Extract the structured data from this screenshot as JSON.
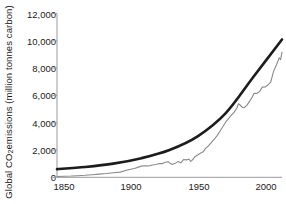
{
  "chart_data": {
    "type": "line",
    "title": "",
    "xlabel": "",
    "ylabel": "Global CO2 emissions (million tonnes carbon)",
    "ylabel_prefix": "Global CO",
    "ylabel_sub": "2",
    "ylabel_suffix": " emissions (million tonnes carbon)",
    "xlim": [
      1850,
      2010
    ],
    "ylim": [
      0,
      12000
    ],
    "grid": false,
    "legend": "none",
    "yticks": [
      0,
      2000,
      4000,
      6000,
      8000,
      10000,
      12000
    ],
    "ytick_labels": [
      "0",
      "2,000",
      "4,000",
      "6,000",
      "8,000",
      "10,000",
      "12,000"
    ],
    "xticks": [
      1850,
      1900,
      1950,
      2000
    ],
    "xtick_labels": [
      "1850",
      "1900",
      "1950",
      "2000"
    ],
    "series": [
      {
        "name": "Observed annual emissions",
        "color": "#8a8a8a",
        "style": "jagged-line",
        "x": [
          1850,
          1855,
          1860,
          1865,
          1870,
          1875,
          1880,
          1885,
          1890,
          1895,
          1900,
          1905,
          1910,
          1913,
          1915,
          1918,
          1920,
          1923,
          1925,
          1927,
          1929,
          1930,
          1932,
          1934,
          1936,
          1938,
          1940,
          1942,
          1944,
          1945,
          1946,
          1948,
          1950,
          1952,
          1954,
          1956,
          1958,
          1960,
          1962,
          1964,
          1966,
          1968,
          1970,
          1972,
          1974,
          1976,
          1978,
          1979,
          1980,
          1982,
          1983,
          1985,
          1987,
          1989,
          1990,
          1991,
          1992,
          1994,
          1996,
          1998,
          2000,
          2002,
          2004,
          2006,
          2008,
          2009,
          2010
        ],
        "y": [
          54,
          76,
          91,
          119,
          147,
          190,
          236,
          276,
          336,
          381,
          534,
          639,
          819,
          843,
          826,
          901,
          932,
          1008,
          1004,
          1100,
          1145,
          1053,
          938,
          1022,
          1150,
          1060,
          1299,
          1276,
          1321,
          1160,
          1238,
          1502,
          1630,
          1767,
          1879,
          2154,
          2332,
          2569,
          2807,
          3069,
          3394,
          3721,
          4053,
          4292,
          4549,
          4776,
          5092,
          5391,
          5316,
          5111,
          5095,
          5267,
          5579,
          5903,
          6143,
          6154,
          6142,
          6277,
          6607,
          6614,
          6770,
          6981,
          7760,
          8230,
          8749,
          8627,
          9167
        ],
        "note": "annual values in million tonnes carbon; dips visible at 1930 (Great Depression), 1945 (end of WWII), 1980-83 (oil shock) and 2009 (financial crisis)"
      },
      {
        "name": "Smooth exponential trend",
        "color": "#1c1c1c",
        "style": "smooth-thick-curve",
        "x": [
          1850,
          1870,
          1890,
          1910,
          1930,
          1950,
          1970,
          1990,
          2010
        ],
        "y": [
          600,
          760,
          1000,
          1400,
          2000,
          3000,
          4700,
          7400,
          10100
        ]
      }
    ],
    "annotations": []
  }
}
